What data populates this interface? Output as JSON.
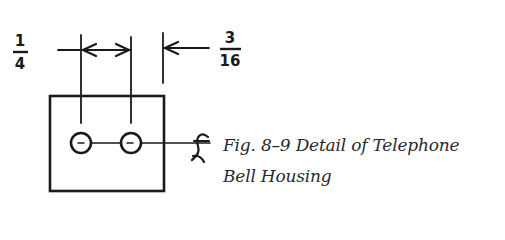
{
  "figure": {
    "label": "Fig. 8–9",
    "caption_line1": "Fig. 8–9 Detail of Telephone",
    "caption_line2": "Bell Housing",
    "title": "Detail of Telephone Bell Housing"
  },
  "dimensions": {
    "left": {
      "numerator": "1",
      "denominator": "4",
      "value": "1/4"
    },
    "right": {
      "numerator": "3",
      "denominator": "16",
      "value": "3/16"
    }
  },
  "symbols": {
    "centerline": "℄"
  },
  "colors": {
    "ink": "#1a1a1a",
    "background": "#ffffff"
  }
}
